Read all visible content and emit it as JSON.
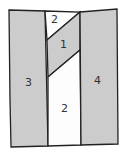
{
  "diagram": {
    "type": "quilt-block-piecing",
    "fill_shaded": "#cccccc",
    "fill_unshaded": "#fdfdfd",
    "stroke": "#222222",
    "pieces": [
      {
        "id": "piece-3",
        "label": "3",
        "shaded": true
      },
      {
        "id": "piece-2-top",
        "label": "2",
        "shaded": false
      },
      {
        "id": "piece-1",
        "label": "1",
        "shaded": true
      },
      {
        "id": "piece-2-bottom",
        "label": "2",
        "shaded": false
      },
      {
        "id": "piece-4",
        "label": "4",
        "shaded": true
      }
    ]
  }
}
